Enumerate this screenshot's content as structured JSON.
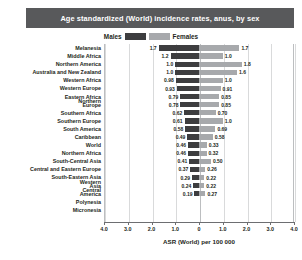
{
  "title": "Age standardized (World) incidence rates, anus, by sex",
  "legend": {
    "male_label": "Males",
    "female_label": "Females",
    "male_color": "#3d3d3f",
    "female_color": "#a7a9ac",
    "position": "top-center"
  },
  "axis": {
    "x_title": "ASR (World) per 100 000",
    "tick_labels": [
      "4.0",
      "3.0",
      "2.0",
      "1.0",
      "0",
      "1.0",
      "2.0",
      "3.0",
      "4.0"
    ],
    "x_max": 4.0
  },
  "chart_data": {
    "type": "bar",
    "orientation": "horizontal-diverging",
    "title": "Age standardized (World) incidence rates, anus, by sex",
    "xlabel": "ASR (World) per 100 000",
    "ylabel": "",
    "xlim": [
      -4.0,
      4.0
    ],
    "grid": true,
    "legend_position": "top-center",
    "categories": [
      "Melanesia",
      "Middle Africa",
      "Northern America",
      "Australia and New Zealand",
      "Western Africa",
      "Western Europe",
      "Eastern Africa",
      "Northern Europe",
      "Southern Africa",
      "Southern Europe",
      "South America",
      "Caribbean",
      "World",
      "Northern Africa",
      "South-Central Asia",
      "Central and Eastern Europe",
      "South-Eastern Asia",
      "Western Asia",
      "Central America",
      "Polynesia",
      "Micronesia"
    ],
    "series": [
      {
        "name": "Males",
        "color": "#3d3d3f",
        "values": [
          1.7,
          1.2,
          1.0,
          1.0,
          0.98,
          0.93,
          0.79,
          0.78,
          0.62,
          0.61,
          0.58,
          0.49,
          0.46,
          0.46,
          0.41,
          0.37,
          0.29,
          0.24,
          0.19,
          null,
          null
        ]
      },
      {
        "name": "Females",
        "color": "#a7a9ac",
        "values": [
          1.7,
          1.0,
          1.8,
          1.6,
          1.0,
          0.91,
          0.85,
          0.85,
          0.7,
          1.0,
          0.69,
          0.58,
          0.33,
          0.32,
          0.5,
          0.26,
          0.22,
          0.22,
          0.27,
          null,
          null
        ]
      }
    ],
    "value_labels_male": [
      "1.7",
      "1.2",
      "1.0",
      "1.0",
      "0.98",
      "0.93",
      "0.79",
      "0.78",
      "0.62",
      "0.61",
      "0.58",
      "0.49",
      "0.46",
      "0.46",
      "0.41",
      "0.37",
      "0.29",
      "0.24",
      "0.19",
      "",
      ""
    ],
    "value_labels_female": [
      "1.7",
      "1.0",
      "1.8",
      "1.6",
      "1.0",
      "0.91",
      "0.85",
      "0.85",
      "0.70",
      "1.0",
      "0.69",
      "0.58",
      "0.33",
      "0.32",
      "0.50",
      "0.26",
      "0.22",
      "0.22",
      "0.27",
      "",
      ""
    ]
  }
}
